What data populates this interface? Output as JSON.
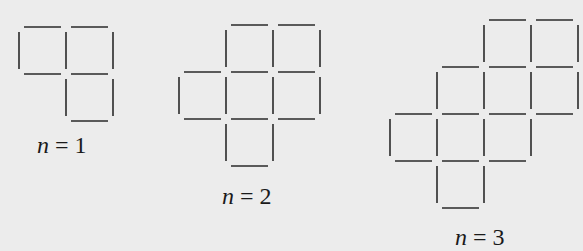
{
  "figures": [
    {
      "label_var": "n",
      "label_eq": " = 1",
      "origin": [
        19,
        27
      ],
      "cell": 47,
      "cells": [
        [
          0,
          0
        ],
        [
          0,
          1
        ],
        [
          1,
          1
        ]
      ]
    },
    {
      "label_var": "n",
      "label_eq": " = 2",
      "origin": [
        179,
        25
      ],
      "cell": 47,
      "cells": [
        [
          0,
          1
        ],
        [
          0,
          2
        ],
        [
          1,
          0
        ],
        [
          1,
          1
        ],
        [
          1,
          2
        ],
        [
          2,
          1
        ]
      ]
    },
    {
      "label_var": "n",
      "label_eq": " = 3",
      "origin": [
        390,
        20
      ],
      "cell": 47,
      "cells": [
        [
          0,
          2
        ],
        [
          0,
          3
        ],
        [
          1,
          1
        ],
        [
          1,
          2
        ],
        [
          1,
          3
        ],
        [
          2,
          0
        ],
        [
          2,
          1
        ],
        [
          2,
          2
        ],
        [
          3,
          1
        ]
      ]
    }
  ],
  "colors": {
    "line": "#2a2a2a",
    "background": "#ececec"
  }
}
